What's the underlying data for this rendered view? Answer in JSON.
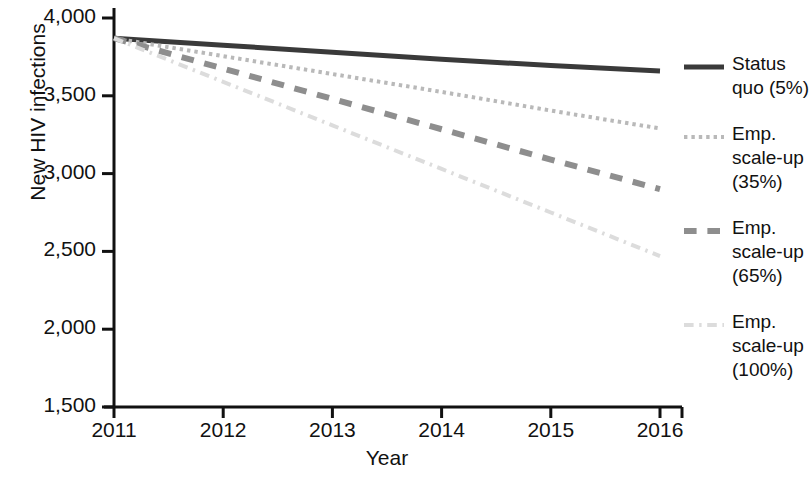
{
  "chart_data": {
    "type": "line",
    "title": "",
    "xlabel": "Year",
    "ylabel": "New HIV infections",
    "x": [
      2011,
      2012,
      2013,
      2014,
      2015,
      2016
    ],
    "xlim": [
      2011,
      2016
    ],
    "ylim": [
      1500,
      4000
    ],
    "ytick_labels": [
      "4,000",
      "3,500",
      "3,000",
      "2,500",
      "2,000",
      "1,500"
    ],
    "ytick_values": [
      4000,
      3500,
      3000,
      2500,
      2000,
      1500
    ],
    "xtick_labels": [
      "2011",
      "2012",
      "2013",
      "2014",
      "2015",
      "2016"
    ],
    "grid": false,
    "legend_position": "right",
    "series": [
      {
        "name": "Status quo (5%)",
        "label_lines": "Status\nquo (5%)",
        "style": "solid",
        "color": "#3a3a3a",
        "width": 5,
        "values": [
          3870,
          3825,
          3780,
          3735,
          3695,
          3660
        ]
      },
      {
        "name": "Emp. scale-up (35%)",
        "label_lines": "Emp.\nscale-up\n(35%)",
        "style": "dotted",
        "color": "#b9b9b9",
        "width": 4,
        "values": [
          3870,
          3755,
          3640,
          3525,
          3405,
          3290
        ]
      },
      {
        "name": "Emp. scale-up (65%)",
        "label_lines": "Emp.\nscale-up\n(65%)",
        "style": "dashed",
        "color": "#8e8e8e",
        "width": 6,
        "values": [
          3870,
          3675,
          3480,
          3285,
          3090,
          2900
        ]
      },
      {
        "name": "Emp. scale-up (100%)",
        "label_lines": "Emp.\nscale-up\n(100%)",
        "style": "dashdot",
        "color": "#dcdcdc",
        "width": 4,
        "values": [
          3870,
          3590,
          3310,
          3030,
          2750,
          2470
        ]
      }
    ]
  },
  "axes": {
    "axis_color": "#111111",
    "background": "#ffffff"
  }
}
